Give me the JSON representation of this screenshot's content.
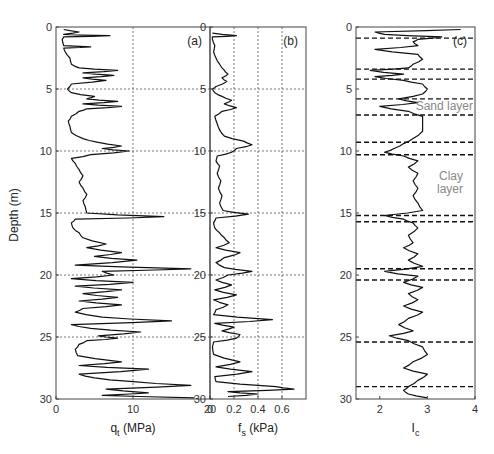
{
  "chart_data": [
    {
      "type": "line",
      "panel": "(a)",
      "orientation": "depth-profile",
      "xlabel": "q",
      "xlabel_sub": "t",
      "xlabel_unit": " (MPa)",
      "ylabel": "Depth (m)",
      "xlim": [
        0,
        20
      ],
      "ylim": [
        30,
        0
      ],
      "xticks": [
        0,
        10,
        20
      ],
      "yticks": [
        0,
        5,
        10,
        15,
        20,
        25,
        30
      ],
      "grid": true,
      "series": [
        {
          "name": "qt",
          "depth": [
            0.2,
            0.4,
            0.6,
            0.7,
            0.8,
            1.0,
            1.5,
            1.6,
            1.7,
            2.0,
            2.5,
            3.0,
            3.3,
            3.5,
            3.7,
            3.9,
            4.1,
            4.3,
            4.6,
            5.0,
            5.3,
            5.6,
            5.8,
            6.0,
            6.2,
            6.4,
            6.6,
            6.8,
            7.2,
            7.6,
            8.0,
            8.5,
            9.0,
            9.3,
            9.6,
            9.8,
            10.0,
            10.3,
            10.6,
            11.0,
            11.5,
            12.0,
            12.5,
            13.0,
            13.5,
            14.0,
            14.5,
            15.0,
            15.3,
            15.5,
            15.8,
            16.2,
            16.6,
            17.0,
            17.5,
            17.8,
            18.2,
            18.5,
            18.8,
            19.2,
            19.5,
            19.7,
            20.0,
            20.3,
            20.6,
            20.9,
            21.2,
            21.5,
            21.8,
            22.1,
            22.4,
            22.7,
            23.0,
            23.4,
            23.7,
            24.0,
            24.3,
            24.6,
            24.9,
            25.1,
            25.3,
            25.6,
            26.0,
            26.5,
            27.0,
            27.3,
            27.6,
            28.0,
            28.3,
            28.6,
            28.9,
            29.2,
            29.5,
            29.7,
            29.9
          ],
          "values": [
            1.0,
            3.0,
            1.0,
            7.0,
            1.0,
            0.8,
            1.0,
            4.5,
            1.0,
            1.2,
            1.8,
            2.0,
            3.0,
            8.0,
            3.5,
            7.5,
            3.5,
            6.5,
            2.0,
            1.5,
            2.0,
            5.0,
            4.0,
            8.0,
            3.5,
            8.5,
            4.0,
            3.0,
            2.0,
            1.6,
            1.8,
            2.0,
            3.5,
            5.5,
            8.5,
            6.0,
            9.5,
            4.5,
            2.0,
            2.5,
            3.0,
            3.5,
            3.0,
            3.5,
            4.0,
            3.5,
            3.8,
            4.0,
            14.0,
            2.5,
            2.0,
            2.2,
            3.0,
            3.5,
            6.5,
            4.0,
            8.5,
            5.0,
            10.5,
            2.5,
            17.5,
            6.0,
            7.5,
            2.0,
            10.0,
            2.5,
            8.5,
            3.5,
            8.0,
            3.0,
            8.5,
            3.5,
            2.5,
            6.0,
            15.0,
            2.0,
            4.5,
            11.0,
            5.5,
            8.0,
            4.0,
            3.0,
            2.5,
            2.8,
            8.5,
            3.0,
            12.0,
            3.0,
            5.0,
            10.0,
            17.5,
            6.5,
            12.0,
            6.0,
            18.0
          ]
        }
      ]
    },
    {
      "type": "line",
      "panel": "(b)",
      "orientation": "depth-profile",
      "xlabel": "f",
      "xlabel_sub": "s",
      "xlabel_unit": " (kPa)",
      "xlim": [
        0,
        0.8
      ],
      "ylim": [
        30,
        0
      ],
      "xticks": [
        0,
        0.2,
        0.4,
        0.6
      ],
      "yticks": [
        0,
        5,
        10,
        15,
        20,
        25,
        30
      ],
      "grid": true,
      "series": [
        {
          "name": "fs",
          "depth": [
            0.5,
            0.7,
            0.8,
            1.0,
            1.5,
            2.0,
            2.5,
            3.0,
            3.5,
            3.8,
            4.1,
            4.4,
            4.8,
            5.0,
            5.3,
            5.6,
            5.9,
            6.2,
            6.5,
            6.8,
            7.2,
            7.8,
            8.3,
            8.8,
            9.2,
            9.5,
            9.8,
            10.1,
            10.4,
            10.8,
            11.2,
            11.8,
            12.4,
            13.0,
            13.6,
            14.2,
            14.8,
            15.1,
            15.4,
            15.8,
            16.2,
            16.6,
            17.0,
            17.4,
            17.8,
            18.2,
            18.6,
            19.0,
            19.4,
            19.7,
            20.0,
            20.4,
            20.8,
            21.2,
            21.6,
            22.0,
            22.4,
            22.8,
            23.2,
            23.6,
            23.9,
            24.2,
            24.5,
            24.8,
            25.1,
            25.4,
            25.8,
            26.4,
            27.0,
            27.4,
            27.8,
            28.2,
            28.6,
            29.0,
            29.2,
            29.4,
            29.6,
            29.8
          ],
          "values": [
            0.02,
            0.22,
            0.02,
            0.02,
            0.04,
            0.03,
            0.05,
            0.08,
            0.12,
            0.15,
            0.1,
            0.14,
            0.05,
            0.02,
            0.04,
            0.1,
            0.18,
            0.12,
            0.22,
            0.1,
            0.04,
            0.06,
            0.08,
            0.12,
            0.28,
            0.35,
            0.22,
            0.18,
            0.06,
            0.05,
            0.08,
            0.06,
            0.09,
            0.07,
            0.1,
            0.08,
            0.11,
            0.32,
            0.05,
            0.03,
            0.04,
            0.08,
            0.12,
            0.16,
            0.05,
            0.25,
            0.12,
            0.05,
            0.12,
            0.35,
            0.15,
            0.05,
            0.18,
            0.04,
            0.22,
            0.03,
            0.15,
            0.05,
            0.03,
            0.52,
            0.04,
            0.2,
            0.1,
            0.25,
            0.22,
            0.03,
            0.02,
            0.03,
            0.25,
            0.05,
            0.35,
            0.04,
            0.05,
            0.55,
            0.7,
            0.15,
            0.4,
            0.15
          ]
        }
      ]
    },
    {
      "type": "line",
      "panel": "(c)",
      "orientation": "depth-profile",
      "xlabel": "I",
      "xlabel_sub": "c",
      "xlabel_unit": "",
      "xlim": [
        1.5,
        4
      ],
      "ylim": [
        30,
        0
      ],
      "xticks": [
        2,
        3,
        4
      ],
      "yticks": [
        0,
        5,
        10,
        15,
        20,
        25,
        30
      ],
      "grid": false,
      "layer_boundaries_depth": [
        0.9,
        3.4,
        4.2,
        5.8,
        7.1,
        9.3,
        10.3,
        15.2,
        15.7,
        19.5,
        20.4,
        25.4,
        29.0
      ],
      "annotations": [
        {
          "text": "Sand layer",
          "depth": 6.4
        },
        {
          "text": "Clay",
          "depth": 12.0
        },
        {
          "text": "layer",
          "depth": 13.1
        }
      ],
      "series": [
        {
          "name": "Ic",
          "depth": [
            0.2,
            0.4,
            0.6,
            0.8,
            1.0,
            1.2,
            1.5,
            1.8,
            2.2,
            2.6,
            3.0,
            3.3,
            3.5,
            3.8,
            4.0,
            4.3,
            4.6,
            5.0,
            5.4,
            5.8,
            6.1,
            6.4,
            6.8,
            7.2,
            7.8,
            8.4,
            9.0,
            9.4,
            9.8,
            10.1,
            10.4,
            10.8,
            11.3,
            11.8,
            12.4,
            13.0,
            13.6,
            14.2,
            14.8,
            15.2,
            15.5,
            15.8,
            16.2,
            16.8,
            17.4,
            17.8,
            18.3,
            18.8,
            19.3,
            19.7,
            20.1,
            20.6,
            21.0,
            21.5,
            22.0,
            22.5,
            23.0,
            23.5,
            24.0,
            24.5,
            24.9,
            25.3,
            25.8,
            26.4,
            27.0,
            27.5,
            28.0,
            28.5,
            29.0,
            29.3,
            29.6,
            29.9
          ],
          "values": [
            3.7,
            1.9,
            2.1,
            3.3,
            2.8,
            2.7,
            2.8,
            1.9,
            2.8,
            2.9,
            2.7,
            2.6,
            1.8,
            2.5,
            1.9,
            2.5,
            2.9,
            3.0,
            2.9,
            2.4,
            2.8,
            2.0,
            2.6,
            2.9,
            2.9,
            2.9,
            2.7,
            2.5,
            2.3,
            2.1,
            2.5,
            2.8,
            2.6,
            2.8,
            2.7,
            2.8,
            2.7,
            2.8,
            2.9,
            2.1,
            2.5,
            2.7,
            2.8,
            2.6,
            2.7,
            2.5,
            2.8,
            2.6,
            2.9,
            2.1,
            2.8,
            2.5,
            2.9,
            2.6,
            2.8,
            2.5,
            2.9,
            2.6,
            2.4,
            2.7,
            2.2,
            2.6,
            2.9,
            3.0,
            2.7,
            2.5,
            3.0,
            2.8,
            2.6,
            2.5,
            2.6,
            3.0
          ]
        }
      ]
    }
  ]
}
